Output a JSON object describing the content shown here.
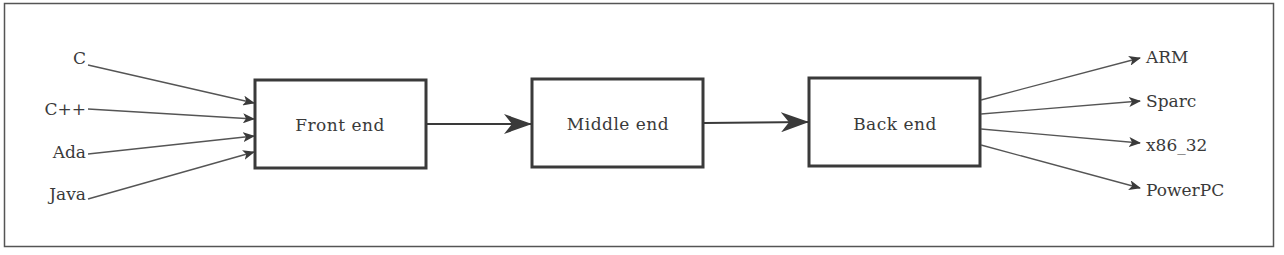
{
  "diagram": {
    "type": "compiler-pipeline",
    "stages": [
      {
        "id": "front",
        "label": "Front end"
      },
      {
        "id": "middle",
        "label": "Middle end"
      },
      {
        "id": "back",
        "label": "Back end"
      }
    ],
    "inputs": [
      "C",
      "C++",
      "Ada",
      "Java"
    ],
    "outputs": [
      "ARM",
      "Sparc",
      "x86_32",
      "PowerPC"
    ],
    "colors": {
      "stroke": "#3a3a3a",
      "text": "#3a3a3a",
      "background": "#ffffff"
    }
  }
}
